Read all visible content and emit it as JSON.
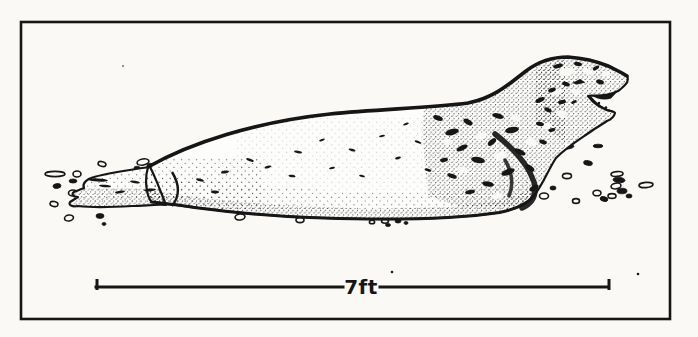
{
  "css_vars": {
    "ink": "#161616",
    "paper": "#faf9f5",
    "bodyfill": "#fdfdfb"
  },
  "figure": {
    "kind": "ink-line-illustration",
    "scale_bar": {
      "label": "7ft"
    }
  }
}
